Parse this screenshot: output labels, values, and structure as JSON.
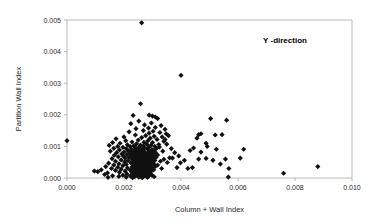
{
  "chart_data": {
    "type": "scatter",
    "title": "",
    "annotation": "Y -direction",
    "xlabel": "Column + Wall Index",
    "ylabel": "Partition Wall Index",
    "xlim": [
      0.0,
      0.01
    ],
    "ylim": [
      0.0,
      0.005
    ],
    "xticks": [
      "0.000",
      "0.002",
      "0.004",
      "0.006",
      "0.008",
      "0.010"
    ],
    "xtick_values": [
      0.0,
      0.002,
      0.004,
      0.006,
      0.008,
      0.01
    ],
    "yticks": [
      "0.000",
      "0.001",
      "0.002",
      "0.003",
      "0.004",
      "0.005"
    ],
    "ytick_values": [
      0.0,
      0.001,
      0.002,
      0.003,
      0.004,
      0.005
    ],
    "grid": false,
    "legend": false,
    "marker": "diamond",
    "marker_color": "#111111",
    "marker_size": 2.6,
    "points": [
      [
        0.0,
        0.00118
      ],
      [
        0.00262,
        0.00491
      ],
      [
        0.004,
        0.00325
      ],
      [
        0.00258,
        0.00235
      ],
      [
        0.00232,
        0.00198
      ],
      [
        0.00288,
        0.00199
      ],
      [
        0.003,
        0.00196
      ],
      [
        0.0031,
        0.00193
      ],
      [
        0.00318,
        0.00188
      ],
      [
        0.00504,
        0.00188
      ],
      [
        0.0056,
        0.00183
      ],
      [
        0.00252,
        0.0018
      ],
      [
        0.00296,
        0.00174
      ],
      [
        0.00224,
        0.00172
      ],
      [
        0.00272,
        0.00168
      ],
      [
        0.0033,
        0.00166
      ],
      [
        0.0031,
        0.0016
      ],
      [
        0.00286,
        0.00158
      ],
      [
        0.00242,
        0.00156
      ],
      [
        0.00344,
        0.00154
      ],
      [
        0.00268,
        0.0015
      ],
      [
        0.00302,
        0.00148
      ],
      [
        0.00218,
        0.00146
      ],
      [
        0.00326,
        0.00144
      ],
      [
        0.00288,
        0.00142
      ],
      [
        0.00348,
        0.0014
      ],
      [
        0.0047,
        0.0014
      ],
      [
        0.0052,
        0.00136
      ],
      [
        0.0024,
        0.00136
      ],
      [
        0.00276,
        0.00134
      ],
      [
        0.00306,
        0.00132
      ],
      [
        0.002,
        0.0013
      ],
      [
        0.00334,
        0.0013
      ],
      [
        0.00262,
        0.00128
      ],
      [
        0.00292,
        0.00126
      ],
      [
        0.00456,
        0.00126
      ],
      [
        0.00172,
        0.00124
      ],
      [
        0.00316,
        0.00122
      ],
      [
        0.0025,
        0.0012
      ],
      [
        0.00284,
        0.00118
      ],
      [
        0.00206,
        0.00118
      ],
      [
        0.0034,
        0.00116
      ],
      [
        0.00228,
        0.00114
      ],
      [
        0.0027,
        0.00113
      ],
      [
        0.003,
        0.00112
      ],
      [
        0.0016,
        0.00112
      ],
      [
        0.00488,
        0.0011
      ],
      [
        0.00186,
        0.0011
      ],
      [
        0.00244,
        0.00108
      ],
      [
        0.0028,
        0.00107
      ],
      [
        0.00322,
        0.00106
      ],
      [
        0.00212,
        0.00105
      ],
      [
        0.00258,
        0.00104
      ],
      [
        0.00294,
        0.00103
      ],
      [
        0.00148,
        0.00103
      ],
      [
        0.00234,
        0.00102
      ],
      [
        0.00268,
        0.00101
      ],
      [
        0.00308,
        0.001
      ],
      [
        0.00178,
        0.001
      ],
      [
        0.00222,
        0.00099
      ],
      [
        0.00254,
        0.00098
      ],
      [
        0.00286,
        0.00097
      ],
      [
        0.00196,
        0.00097
      ],
      [
        0.0024,
        0.00096
      ],
      [
        0.00272,
        0.00095
      ],
      [
        0.00314,
        0.00094
      ],
      [
        0.00164,
        0.00094
      ],
      [
        0.00208,
        0.00093
      ],
      [
        0.00248,
        0.00092
      ],
      [
        0.00282,
        0.00092
      ],
      [
        0.00226,
        0.00091
      ],
      [
        0.00262,
        0.0009
      ],
      [
        0.00298,
        0.0009
      ],
      [
        0.00184,
        0.00089
      ],
      [
        0.00236,
        0.00088
      ],
      [
        0.00266,
        0.00088
      ],
      [
        0.00304,
        0.00087
      ],
      [
        0.00214,
        0.00086
      ],
      [
        0.00252,
        0.00086
      ],
      [
        0.00288,
        0.00085
      ],
      [
        0.00152,
        0.00085
      ],
      [
        0.0023,
        0.00084
      ],
      [
        0.0026,
        0.00084
      ],
      [
        0.00292,
        0.00083
      ],
      [
        0.002,
        0.00082
      ],
      [
        0.00244,
        0.00082
      ],
      [
        0.00274,
        0.00081
      ],
      [
        0.0031,
        0.00081
      ],
      [
        0.00174,
        0.0008
      ],
      [
        0.0022,
        0.0008
      ],
      [
        0.00256,
        0.00079
      ],
      [
        0.00284,
        0.00079
      ],
      [
        0.00238,
        0.00078
      ],
      [
        0.00268,
        0.00077
      ],
      [
        0.003,
        0.00077
      ],
      [
        0.00192,
        0.00076
      ],
      [
        0.00232,
        0.00076
      ],
      [
        0.00264,
        0.00075
      ],
      [
        0.00294,
        0.00075
      ],
      [
        0.0021,
        0.00074
      ],
      [
        0.00248,
        0.00074
      ],
      [
        0.00278,
        0.00073
      ],
      [
        0.00318,
        0.00073
      ],
      [
        0.00166,
        0.00072
      ],
      [
        0.00226,
        0.00072
      ],
      [
        0.00258,
        0.00071
      ],
      [
        0.00286,
        0.00071
      ],
      [
        0.00242,
        0.0007
      ],
      [
        0.0027,
        0.0007
      ],
      [
        0.00306,
        0.00069
      ],
      [
        0.00198,
        0.00069
      ],
      [
        0.00234,
        0.00068
      ],
      [
        0.00262,
        0.00068
      ],
      [
        0.0029,
        0.00067
      ],
      [
        0.0018,
        0.00067
      ],
      [
        0.00218,
        0.00066
      ],
      [
        0.00252,
        0.00066
      ],
      [
        0.0028,
        0.00065
      ],
      [
        0.00312,
        0.00065
      ],
      [
        0.00238,
        0.00064
      ],
      [
        0.00266,
        0.00064
      ],
      [
        0.00296,
        0.00063
      ],
      [
        0.00204,
        0.00063
      ],
      [
        0.00246,
        0.00062
      ],
      [
        0.00274,
        0.00062
      ],
      [
        0.00302,
        0.00061
      ],
      [
        0.00158,
        0.00061
      ],
      [
        0.00228,
        0.0006
      ],
      [
        0.00256,
        0.0006
      ],
      [
        0.00284,
        0.00059
      ],
      [
        0.0034,
        0.00059
      ],
      [
        0.0024,
        0.00058
      ],
      [
        0.00268,
        0.00058
      ],
      [
        0.00298,
        0.00057
      ],
      [
        0.0019,
        0.00057
      ],
      [
        0.0025,
        0.00056
      ],
      [
        0.00278,
        0.00056
      ],
      [
        0.00308,
        0.00055
      ],
      [
        0.00214,
        0.00055
      ],
      [
        0.0026,
        0.00054
      ],
      [
        0.00288,
        0.00054
      ],
      [
        0.00328,
        0.00053
      ],
      [
        0.0017,
        0.00053
      ],
      [
        0.00236,
        0.00052
      ],
      [
        0.00264,
        0.00052
      ],
      [
        0.00292,
        0.00051
      ],
      [
        0.00202,
        0.00051
      ],
      [
        0.00244,
        0.0005
      ],
      [
        0.00272,
        0.0005
      ],
      [
        0.003,
        0.00049
      ],
      [
        0.00352,
        0.00049
      ],
      [
        0.00224,
        0.00048
      ],
      [
        0.00254,
        0.00048
      ],
      [
        0.00282,
        0.00047
      ],
      [
        0.00146,
        0.00047
      ],
      [
        0.00232,
        0.00046
      ],
      [
        0.00262,
        0.00046
      ],
      [
        0.0029,
        0.00045
      ],
      [
        0.00182,
        0.00045
      ],
      [
        0.00246,
        0.00044
      ],
      [
        0.00276,
        0.00044
      ],
      [
        0.00306,
        0.00043
      ],
      [
        0.00208,
        0.00043
      ],
      [
        0.00256,
        0.00042
      ],
      [
        0.00284,
        0.00042
      ],
      [
        0.00318,
        0.00041
      ],
      [
        0.00164,
        0.00041
      ],
      [
        0.00238,
        0.0004
      ],
      [
        0.00266,
        0.0004
      ],
      [
        0.00294,
        0.00039
      ],
      [
        0.00196,
        0.00039
      ],
      [
        0.00248,
        0.00038
      ],
      [
        0.00278,
        0.00038
      ],
      [
        0.0031,
        0.00037
      ],
      [
        0.0088,
        0.00036
      ],
      [
        0.00136,
        0.00036
      ],
      [
        0.00228,
        0.00035
      ],
      [
        0.00258,
        0.00035
      ],
      [
        0.00288,
        0.00034
      ],
      [
        0.00178,
        0.00034
      ],
      [
        0.0024,
        0.00033
      ],
      [
        0.0027,
        0.00033
      ],
      [
        0.003,
        0.00032
      ],
      [
        0.00212,
        0.00032
      ],
      [
        0.00252,
        0.00031
      ],
      [
        0.00282,
        0.00031
      ],
      [
        0.00332,
        0.0003
      ],
      [
        0.00156,
        0.0003
      ],
      [
        0.00234,
        0.00029
      ],
      [
        0.00264,
        0.00029
      ],
      [
        0.00292,
        0.00028
      ],
      [
        0.0019,
        0.00028
      ],
      [
        0.00244,
        0.00027
      ],
      [
        0.00274,
        0.00027
      ],
      [
        0.00304,
        0.00026
      ],
      [
        0.0012,
        0.00026
      ],
      [
        0.00222,
        0.00025
      ],
      [
        0.00256,
        0.00025
      ],
      [
        0.00286,
        0.00024
      ],
      [
        0.0017,
        0.00024
      ],
      [
        0.00236,
        0.00023
      ],
      [
        0.00266,
        0.00023
      ],
      [
        0.00296,
        0.00022
      ],
      [
        0.00204,
        0.00022
      ],
      [
        0.00248,
        0.00021
      ],
      [
        0.00278,
        0.00021
      ],
      [
        0.00108,
        0.0002
      ],
      [
        0.00226,
        0.0002
      ],
      [
        0.00258,
        0.00019
      ],
      [
        0.00288,
        0.00019
      ],
      [
        0.00184,
        0.00018
      ],
      [
        0.0024,
        0.00017
      ],
      [
        0.0027,
        0.00017
      ],
      [
        0.0076,
        0.00015
      ],
      [
        0.00142,
        0.00016
      ],
      [
        0.0023,
        0.00015
      ],
      [
        0.00262,
        0.00015
      ],
      [
        0.00292,
        0.00014
      ],
      [
        0.0021,
        0.00013
      ],
      [
        0.0025,
        0.00013
      ],
      [
        0.0028,
        0.00012
      ],
      [
        0.00096,
        0.00022
      ],
      [
        0.00132,
        0.00011
      ],
      [
        0.00234,
        0.0001
      ],
      [
        0.00266,
        0.0001
      ],
      [
        0.00298,
        9e-05
      ],
      [
        0.00196,
        9e-05
      ],
      [
        0.00246,
        8e-05
      ],
      [
        0.00276,
        8e-05
      ],
      [
        0.0016,
        7e-05
      ],
      [
        0.00222,
        7e-05
      ],
      [
        0.00256,
        6e-05
      ],
      [
        0.00286,
        6e-05
      ],
      [
        0.00182,
        5e-05
      ],
      [
        0.00238,
        5e-05
      ],
      [
        0.00268,
        4e-05
      ],
      [
        0.00306,
        4e-05
      ],
      [
        0.00208,
        3e-05
      ],
      [
        0.00252,
        3e-05
      ],
      [
        0.00282,
        2e-05
      ],
      [
        0.00144,
        2e-05
      ],
      [
        0.0023,
        1e-05
      ],
      [
        0.00264,
        1e-05
      ],
      [
        0.00566,
        3e-05
      ],
      [
        0.00568,
        0.0003
      ],
      [
        0.00538,
        0.00044
      ],
      [
        0.00556,
        0.0006
      ],
      [
        0.00512,
        0.00056
      ],
      [
        0.00488,
        0.00062
      ],
      [
        0.00462,
        0.0006
      ],
      [
        0.0044,
        0.00033
      ],
      [
        0.00424,
        0.0003
      ],
      [
        0.00412,
        0.00056
      ],
      [
        0.00398,
        0.00048
      ],
      [
        0.00386,
        0.00033
      ],
      [
        0.0037,
        0.00063
      ],
      [
        0.0036,
        0.00064
      ],
      [
        0.00444,
        0.00095
      ],
      [
        0.0047,
        0.00082
      ],
      [
        0.00492,
        0.001
      ],
      [
        0.00432,
        0.00087
      ],
      [
        0.00524,
        0.00091
      ],
      [
        0.00544,
        0.00137
      ],
      [
        0.00608,
        0.00063
      ],
      [
        0.0062,
        0.00091
      ],
      [
        0.00462,
        0.00137
      ],
      [
        0.0035,
        0.00107
      ],
      [
        0.00366,
        0.00093
      ],
      [
        0.00378,
        0.0008
      ],
      [
        0.00392,
        0.0007
      ],
      [
        0.00336,
        0.00085
      ],
      [
        0.00324,
        0.00098
      ],
      [
        0.00344,
        0.00122
      ],
      [
        0.00356,
        0.00134
      ]
    ]
  },
  "axes": {
    "x_title": "Column + Wall Index",
    "y_title": "Partition Wall Index"
  }
}
